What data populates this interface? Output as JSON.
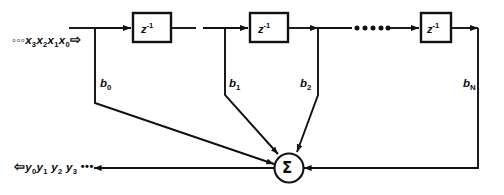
{
  "figure": {
    "kind": "fir-filter-block-diagram",
    "title": "",
    "stroke_color": "#111111",
    "background_color": "#ffffff"
  },
  "input": {
    "leading_dots": "◦◦◦",
    "samples": [
      "x",
      "x",
      "x",
      "x"
    ],
    "subscripts": [
      "3",
      "2",
      "1",
      "0"
    ],
    "arrow": "⇨",
    "label_text": "◦◦◦ x3 x2 x1 x0"
  },
  "output": {
    "arrow": "⇦",
    "samples": [
      "y",
      "y",
      "y",
      "y"
    ],
    "subscripts": [
      "0",
      "1",
      "2",
      "3"
    ],
    "trailing_dots": "•••",
    "tail_arrow": "←",
    "label_text": "⇦ y0 y1 y2 y3 ••• ←"
  },
  "delay_blocks": [
    {
      "id": "delay-1",
      "label_base": "z",
      "label_exp": "-1"
    },
    {
      "id": "delay-2",
      "label_base": "z",
      "label_exp": "-1"
    },
    {
      "id": "delay-n",
      "label_base": "z",
      "label_exp": "-1"
    }
  ],
  "ellipsis": {
    "dots": "•••••",
    "count": 5
  },
  "coefficients": [
    {
      "id": "tap-b0",
      "base": "b",
      "sub": "0"
    },
    {
      "id": "tap-b1",
      "base": "b",
      "sub": "1"
    },
    {
      "id": "tap-b2",
      "base": "b",
      "sub": "2"
    },
    {
      "id": "tap-bn",
      "base": "b",
      "sub": "N"
    }
  ],
  "summer": {
    "symbol": "Σ",
    "name": "summation-node"
  }
}
